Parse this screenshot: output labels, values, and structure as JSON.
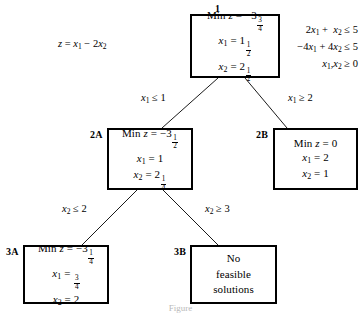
{
  "diagram": {
    "type": "branch-and-bound-tree",
    "caption": "Figure",
    "objective": "z = x1 - 2x2",
    "constraints": [
      "2x1 +  x2 <= 5",
      "-4x1 + 4x2 <= 5",
      "x1, x2 >= 0"
    ],
    "nodes": [
      {
        "id": "1",
        "lines": [
          "Min z = -3 3/4",
          "x1 = 1 1/2",
          "x2 = 2 1/2"
        ],
        "status": "fractional"
      },
      {
        "id": "2A",
        "lines": [
          "Min z = -3 1/2",
          "x1 = 1",
          "x2 = 2 1/4"
        ],
        "status": "fractional"
      },
      {
        "id": "2B",
        "lines": [
          "Min z = 0",
          "x1 = 2",
          "x2 = 1"
        ],
        "status": "integer"
      },
      {
        "id": "3A",
        "lines": [
          "Min z = -3 1/4",
          "x1 = 3/4",
          "x2 = 2"
        ],
        "status": "fractional"
      },
      {
        "id": "3B",
        "lines": [
          "No",
          "feasible",
          "solutions"
        ],
        "status": "infeasible"
      }
    ],
    "edges": [
      {
        "from": "1",
        "to": "2A",
        "label": "x1 <= 1"
      },
      {
        "from": "1",
        "to": "2B",
        "label": "x1 >= 2"
      },
      {
        "from": "2A",
        "to": "3A",
        "label": "x2 <= 2"
      },
      {
        "from": "2A",
        "to": "3B",
        "label": "x2 >= 3"
      }
    ]
  },
  "colors": {
    "line": "#000000",
    "background": "#ffffff",
    "caption": "#b9b9b9"
  }
}
